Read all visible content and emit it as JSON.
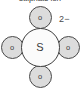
{
  "diagram": {
    "title": "sulphate ion",
    "charge_label": "2−",
    "type": "ball-and-stick-ion-diagram",
    "colors": {
      "oxygen_fill": "#dcdcdc",
      "sulfur_fill": "#fbfbfb",
      "outline": "#4a4a4a",
      "text": "#3c3c3c",
      "background": "#ffffff"
    },
    "atoms": [
      {
        "label": "o",
        "element": "oxygen",
        "position": "top"
      },
      {
        "label": "o",
        "element": "oxygen",
        "position": "left"
      },
      {
        "label": "S",
        "element": "sulfur",
        "position": "center"
      },
      {
        "label": "o",
        "element": "oxygen",
        "position": "right"
      },
      {
        "label": "o",
        "element": "oxygen",
        "position": "bottom"
      }
    ]
  }
}
